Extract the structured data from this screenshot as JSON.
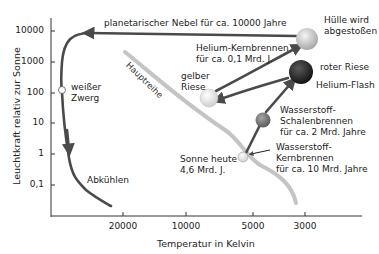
{
  "diagram": {
    "y_axis": {
      "label": "Leuchtkraft relativ zur Sonne",
      "ticks": [
        "10000",
        "1000",
        "100",
        "10",
        "1",
        "0,1"
      ],
      "scale": "log"
    },
    "x_axis": {
      "label": "Temperatur in Kelvin",
      "ticks": [
        "20000",
        "10000",
        "5000",
        "3000"
      ],
      "direction": "decreasing"
    },
    "main_sequence_label": "Hauptreihe",
    "stages": [
      {
        "id": "sun_today",
        "label_lines": [
          "Sonne heute",
          "4,6 Mrd. J."
        ],
        "color": "#e0e0e0"
      },
      {
        "id": "h_core",
        "label_lines": [
          "Wasserstoff-",
          "Kernbrennen",
          "für ca. 10 Mrd. Jahre"
        ]
      },
      {
        "id": "h_shell",
        "label_lines": [
          "Wasserstoff-",
          "Schalenbrennen",
          "für ca. 2 Mrd. Jahre"
        ],
        "color": "#7a7a7a"
      },
      {
        "id": "red_giant",
        "label_lines": [
          "roter Riese"
        ],
        "color": "#2a2a2a"
      },
      {
        "id": "helium_flash",
        "label_lines": [
          "Helium-Flash"
        ]
      },
      {
        "id": "yellow_giant",
        "label_lines": [
          "gelber",
          "Riese"
        ],
        "color": "#e8e8e8"
      },
      {
        "id": "he_core",
        "label_lines": [
          "Helium-Kernbrennen",
          "für ca. 0,1 Mrd. J."
        ]
      },
      {
        "id": "envelope",
        "label_lines": [
          "Hülle wird",
          "abgestoßen"
        ],
        "color": "#c8c8c8"
      },
      {
        "id": "planetary_nebula",
        "label_lines": [
          "planetarischer Nebel für ca. 10000 Jahre"
        ]
      },
      {
        "id": "white_dwarf",
        "label_lines": [
          "weißer",
          "Zwerg"
        ],
        "color": "#ffffff"
      },
      {
        "id": "cooling",
        "label_lines": [
          "Abkühlen"
        ]
      }
    ],
    "colors": {
      "track": "#4a4a4a",
      "main_sequence": "#c4c4c4",
      "axis": "#333333",
      "text": "#222222"
    }
  }
}
